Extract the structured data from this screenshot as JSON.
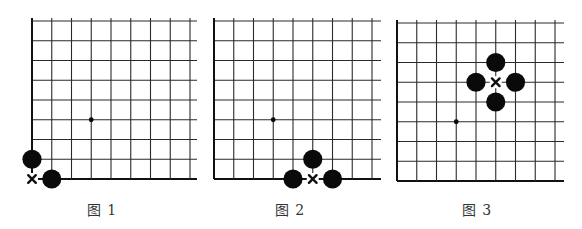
{
  "colors": {
    "line": "#2a2a2a",
    "edge": "#111111",
    "stone": "#0a0a0a",
    "mark": "#111111",
    "caption": "#333333",
    "background": "#ffffff"
  },
  "grid": {
    "rows": 9,
    "cols": 9,
    "spacing": 19.75
  },
  "diagrams": [
    {
      "caption": "图 1",
      "origin": [
        32,
        21
      ],
      "right_overhang": 7,
      "top_overhang": 3,
      "star_point": [
        3,
        5
      ],
      "stones": [
        {
          "color": "black",
          "col": 0,
          "row": 7
        },
        {
          "color": "black",
          "col": 1,
          "row": 8
        }
      ],
      "marks": [
        {
          "type": "x",
          "col": 0,
          "row": 8
        }
      ],
      "caption_x": 102
    },
    {
      "caption": "图 2",
      "origin": [
        214,
        21
      ],
      "right_overhang": 9,
      "top_overhang": 3,
      "star_point": [
        3,
        5
      ],
      "stones": [
        {
          "color": "black",
          "col": 4,
          "row": 8
        },
        {
          "color": "black",
          "col": 6,
          "row": 8
        },
        {
          "color": "black",
          "col": 5,
          "row": 7
        }
      ],
      "marks": [
        {
          "type": "x",
          "col": 5,
          "row": 8
        }
      ],
      "caption_x": 290
    },
    {
      "caption": "图 3",
      "origin": [
        397,
        23
      ],
      "right_overhang": 9,
      "top_overhang": 3,
      "star_point": [
        3,
        5
      ],
      "stones": [
        {
          "color": "black",
          "col": 5,
          "row": 2
        },
        {
          "color": "black",
          "col": 4,
          "row": 3
        },
        {
          "color": "black",
          "col": 6,
          "row": 3
        },
        {
          "color": "black",
          "col": 5,
          "row": 4
        }
      ],
      "marks": [
        {
          "type": "x",
          "col": 5,
          "row": 3
        }
      ],
      "caption_x": 477
    }
  ]
}
